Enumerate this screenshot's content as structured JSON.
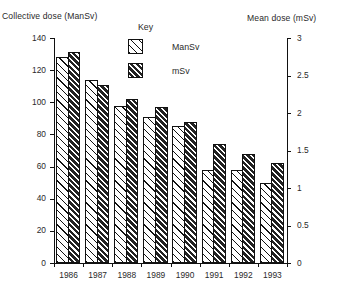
{
  "axes": {
    "left_title": "Collective dose (ManSv)",
    "right_title": "Mean dose (mSv)",
    "left_ticks": [
      "140",
      "120",
      "100",
      "80",
      "60",
      "40",
      "20",
      "0"
    ],
    "right_ticks": [
      "3",
      "2.5",
      "2",
      "1.5",
      "1",
      "0.5",
      "0"
    ]
  },
  "legend": {
    "title": "Key",
    "items": [
      {
        "label": "ManSv",
        "swatch": "sparse-diagonal-hatch"
      },
      {
        "label": "mSv",
        "swatch": "dense-diagonal-hatch"
      }
    ]
  },
  "chart_data": {
    "type": "bar",
    "title": "",
    "categories": [
      "1986",
      "1987",
      "1988",
      "1989",
      "1990",
      "1991",
      "1992",
      "1993"
    ],
    "series": [
      {
        "name": "ManSv",
        "axis": "left",
        "values": [
          128,
          114,
          98,
          91,
          85,
          58,
          58,
          50
        ]
      },
      {
        "name": "mSv",
        "axis": "right",
        "values": [
          2.81,
          2.38,
          2.19,
          2.08,
          1.89,
          1.59,
          1.46,
          1.33
        ]
      }
    ],
    "msv_in_left_units": [
      131,
      111,
      102,
      97,
      88,
      74,
      68,
      62
    ],
    "xlabel": "",
    "ylabel": "Collective dose (ManSv)",
    "y2label": "Mean dose (mSv)",
    "ylim": [
      0,
      140
    ],
    "y2lim": [
      0,
      3
    ],
    "grid": false,
    "legend_position": "top-center"
  }
}
